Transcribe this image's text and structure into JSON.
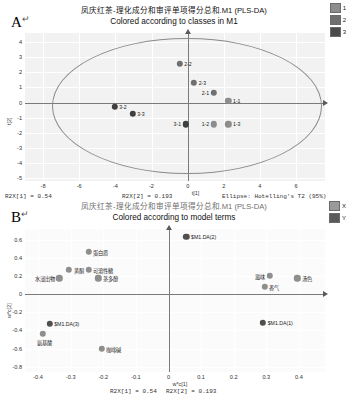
{
  "chart_data": [
    {
      "type": "scatter",
      "panel": "A",
      "title": "凤庆红茶-理化成分和审评单项得分总和.M1 (PLS-DA)",
      "subtitle": "Colored according to classes in M1",
      "xlabel": "t[1]",
      "ylabel": "t[2]",
      "xlim": [
        -9,
        7.6
      ],
      "ylim": [
        -5.2,
        4.6
      ],
      "xticks": [
        -8,
        -6,
        -4,
        -2,
        0,
        2,
        4,
        6
      ],
      "yticks": [
        -5,
        -4,
        -3,
        -2,
        -1,
        0,
        1,
        2,
        3,
        4
      ],
      "grid": true,
      "legend_position": "top-right",
      "legend": [
        {
          "label": "1",
          "color": "#8d8d8d"
        },
        {
          "label": "2",
          "color": "#6f6f6f"
        },
        {
          "label": "3",
          "color": "#4a4a4a"
        }
      ],
      "ellipse": {
        "label": "Ellipse: Hotelling's T2 (95%)",
        "cx": -0.1,
        "cy": -0.15,
        "rx": 7.4,
        "ry": 4.45
      },
      "points": [
        {
          "label": "2-2",
          "x": -0.45,
          "y": 2.55,
          "class": "2",
          "label_side": "right"
        },
        {
          "label": "2-3",
          "x": 0.35,
          "y": 1.3,
          "class": "2",
          "label_side": "right"
        },
        {
          "label": "2-1",
          "x": 1.45,
          "y": 0.62,
          "class": "2",
          "label_side": "left"
        },
        {
          "label": "1-1",
          "x": 2.25,
          "y": 0.1,
          "class": "1",
          "label_side": "right"
        },
        {
          "label": "1-2",
          "x": 1.45,
          "y": -1.45,
          "class": "1",
          "label_side": "left"
        },
        {
          "label": "1-3",
          "x": 2.25,
          "y": -1.45,
          "class": "1",
          "label_side": "right"
        },
        {
          "label": "3-1",
          "x": -0.1,
          "y": -1.45,
          "class": "3",
          "label_side": "left"
        },
        {
          "label": "3-2",
          "x": -4.05,
          "y": -0.3,
          "class": "3",
          "label_side": "right"
        },
        {
          "label": "3-3",
          "x": -3.05,
          "y": -0.75,
          "class": "3",
          "label_side": "right"
        }
      ],
      "footnotes": {
        "r2x1": "R2X[1] = 0.54",
        "r2x2": "R2X[2] = 0.193",
        "ellipse_note": "Ellipse: Hotelling's T2 (95%)"
      }
    },
    {
      "type": "scatter",
      "panel": "B",
      "title": "凤庆红茶-理化成分和审评单项得分总和.M1 (PLS-DA)",
      "subtitle": "Colored according to model terms",
      "xlabel": "w*c[1]",
      "ylabel": "w*c[2]",
      "xlim": [
        -0.44,
        0.48
      ],
      "ylim": [
        -0.86,
        0.72
      ],
      "xticks": [
        -0.4,
        -0.3,
        -0.2,
        -0.1,
        0,
        0.1,
        0.2,
        0.3,
        0.4
      ],
      "xticklabels": [
        "-0.4",
        "-0.3",
        "-0.2",
        "-0.1",
        "0",
        "0.1",
        "0.2",
        "0.3",
        "0.4"
      ],
      "yticks": [
        -0.8,
        -0.6,
        -0.4,
        -0.2,
        0,
        0.2,
        0.4,
        0.6
      ],
      "yticklabels": [
        "-0.8",
        "-0.6",
        "-0.4",
        "-0.2",
        "0",
        "0.2",
        "0.4",
        "0.6"
      ],
      "grid": true,
      "legend_position": "top-right",
      "legend": [
        {
          "label": "X",
          "color": "#9a9a9a"
        },
        {
          "label": "Y",
          "color": "#5a5a5a"
        }
      ],
      "points": [
        {
          "label": "$M1.DA(2)",
          "x": 0.055,
          "y": 0.635,
          "kind": "Y",
          "label_side": "right"
        },
        {
          "label": "蛋白质",
          "x": -0.245,
          "y": 0.47,
          "kind": "X",
          "label_side": "right"
        },
        {
          "label": "黄酮",
          "x": -0.305,
          "y": 0.27,
          "kind": "X",
          "label_side": "right"
        },
        {
          "label": "可溶性糖",
          "x": -0.245,
          "y": 0.27,
          "kind": "X",
          "label_side": "right"
        },
        {
          "label": "水浸出物",
          "x": -0.335,
          "y": 0.175,
          "kind": "X",
          "label_side": "left"
        },
        {
          "label": "茶多酚",
          "x": -0.215,
          "y": 0.175,
          "kind": "X",
          "label_side": "right"
        },
        {
          "label": "滋味",
          "x": 0.31,
          "y": 0.205,
          "kind": "X",
          "label_side": "left"
        },
        {
          "label": "汤色",
          "x": 0.395,
          "y": 0.175,
          "kind": "X",
          "label_side": "right"
        },
        {
          "label": "香气",
          "x": 0.295,
          "y": 0.08,
          "kind": "X",
          "label_side": "right"
        },
        {
          "label": "$M1.DA(1)",
          "x": 0.29,
          "y": -0.315,
          "kind": "Y",
          "label_side": "right"
        },
        {
          "label": "$M1.DA(3)",
          "x": -0.365,
          "y": -0.33,
          "kind": "Y",
          "label_side": "right"
        },
        {
          "label": "氨基酸",
          "x": -0.385,
          "y": -0.44,
          "kind": "X",
          "label_side": "below"
        },
        {
          "label": "咖啡碱",
          "x": -0.205,
          "y": -0.6,
          "kind": "X",
          "label_side": "right"
        }
      ],
      "footnotes": {
        "r2x1": "R2X[1] = 0.54",
        "r2x2": "R2X[2] = 0.193"
      }
    }
  ],
  "panels": {
    "a": {
      "letter": "A",
      "cr": "↵"
    },
    "b": {
      "letter": "B",
      "cr": "↵"
    }
  }
}
